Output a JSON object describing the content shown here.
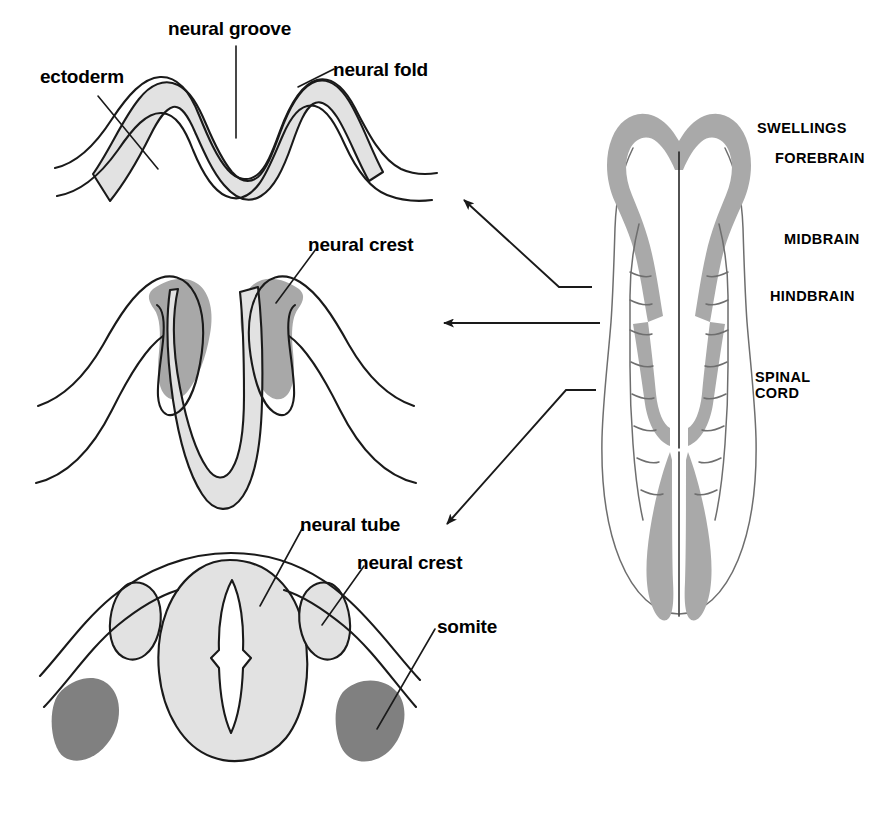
{
  "diagram": {
    "background_color": "#ffffff",
    "stroke_color": "#1a1a1a",
    "colors": {
      "neural_plate_light": "#e2e2e2",
      "neural_crest_mid": "#a8a8a8",
      "somite_dark": "#808080",
      "swelling_gray": "#a9a9a9",
      "text": "#000000"
    }
  },
  "panels": {
    "top": {
      "name": "neural groove stage",
      "labels": [
        {
          "id": "ectoderm",
          "text": "ectoderm",
          "x": 40,
          "y": 66
        },
        {
          "id": "neural_groove",
          "text": "neural groove",
          "x": 168,
          "y": 18
        },
        {
          "id": "neural_fold",
          "text": "neural fold",
          "x": 333,
          "y": 59
        }
      ]
    },
    "middle": {
      "name": "neural fold elevation stage",
      "labels": [
        {
          "id": "neural_crest",
          "text": "neural crest",
          "x": 308,
          "y": 234
        }
      ]
    },
    "bottom": {
      "name": "closed neural tube stage",
      "labels": [
        {
          "id": "neural_tube",
          "text": "neural tube",
          "x": 300,
          "y": 514
        },
        {
          "id": "neural_crest",
          "text": "neural crest",
          "x": 357,
          "y": 552
        },
        {
          "id": "somite",
          "text": "somite",
          "x": 437,
          "y": 616
        }
      ]
    },
    "right": {
      "name": "dorsal view of developing neural tube",
      "labels": [
        {
          "id": "swellings",
          "text": "SWELLINGS",
          "x": 757,
          "y": 120
        },
        {
          "id": "forebrain",
          "text": "FOREBRAIN",
          "x": 775,
          "y": 150
        },
        {
          "id": "midbrain",
          "text": "MIDBRAIN",
          "x": 784,
          "y": 231
        },
        {
          "id": "hindbrain",
          "text": "HINDBRAIN",
          "x": 770,
          "y": 288
        },
        {
          "id": "spinal_cord_line1",
          "text": "SPINAL",
          "x": 755,
          "y": 369
        },
        {
          "id": "spinal_cord_line2",
          "text": "CORD",
          "x": 755,
          "y": 385
        }
      ]
    }
  },
  "connectors": [
    {
      "id": "arrow-to-top-panel",
      "from": "right-panel-forebrain-level",
      "to": "top-panel",
      "direction": "up-left"
    },
    {
      "id": "arrow-to-middle-panel",
      "from": "right-panel-hindbrain-level",
      "to": "middle-panel",
      "direction": "left"
    },
    {
      "id": "arrow-to-bottom-panel",
      "from": "right-panel-spinal-level",
      "to": "bottom-panel",
      "direction": "down-left"
    }
  ]
}
